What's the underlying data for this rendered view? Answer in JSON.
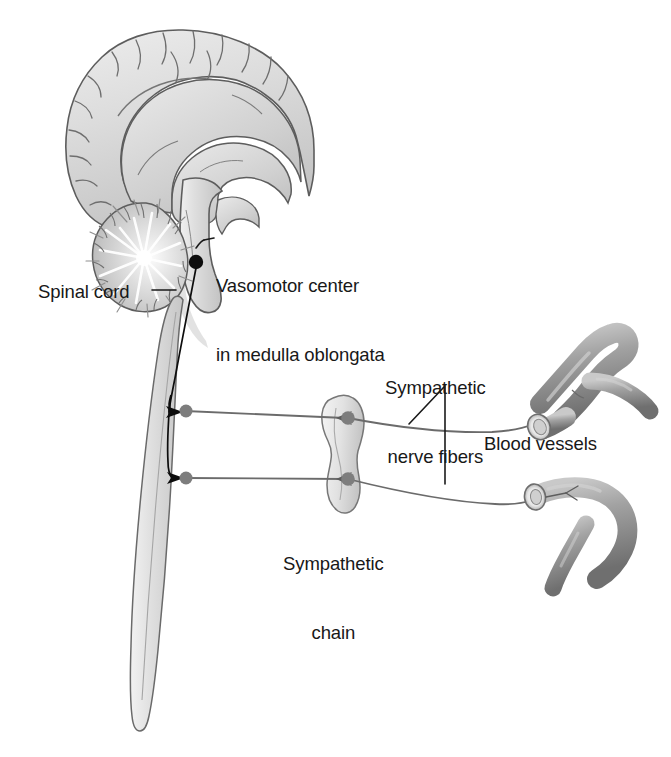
{
  "figure": {
    "background_color": "#ffffff",
    "width": 671,
    "height": 757
  },
  "palette": {
    "tissue_fill_light": "#e3e3e3",
    "tissue_fill_mid": "#d2d2d2",
    "tissue_fill_dark": "#b4b4b4",
    "outline": "#5d5d5d",
    "outline_dark": "#3c3c3c",
    "nerve_line": "#6b6b6b",
    "nerve_node": "#7d7d7d",
    "pathway_line": "#0d0d0d",
    "vessel_fill": "#9a9a9a",
    "vessel_shadow": "#6e6e6e",
    "vessel_lumen": "#efefef",
    "label_text": "#181818",
    "leader_line": "#1a1a1a"
  },
  "labels": {
    "vasomotor": {
      "line1": "Vasomotor center",
      "line2": "in medulla oblongata",
      "text": "Vasomotor center\nin medulla oblongata"
    },
    "spinal_cord": {
      "text": "Spinal cord"
    },
    "sympathetic_nerve_fibers": {
      "line1": "Sympathetic",
      "line2": "nerve fibers",
      "text": "Sympathetic\nnerve fibers"
    },
    "blood_vessels": {
      "text": "Blood vessels"
    },
    "sympathetic_chain": {
      "line1": "Sympathetic",
      "line2": "chain",
      "text": "Sympathetic\nchain"
    }
  },
  "structures": [
    {
      "id": "cerebrum",
      "name": "Cerebrum (midsagittal section)"
    },
    {
      "id": "corpus-callosum",
      "name": "Corpus callosum"
    },
    {
      "id": "thalamus",
      "name": "Thalamus / diencephalon"
    },
    {
      "id": "cerebellum",
      "name": "Cerebellum with arbor vitae"
    },
    {
      "id": "brainstem",
      "name": "Brainstem / pons"
    },
    {
      "id": "medulla-oblongata",
      "name": "Medulla oblongata"
    },
    {
      "id": "spinal-cord",
      "name": "Spinal cord"
    },
    {
      "id": "vasomotor-center",
      "name": "Vasomotor center marker"
    },
    {
      "id": "sympathetic-chain-ganglion",
      "name": "Sympathetic chain ganglion"
    },
    {
      "id": "blood-vessel-upper",
      "name": "Upper branching blood vessel"
    },
    {
      "id": "blood-vessel-lower",
      "name": "Lower branching blood vessel"
    }
  ],
  "pathway": {
    "description": "Descending pathway from vasomotor center through spinal cord to preganglionic exit points",
    "exit_points": 2
  },
  "nerve_fibers": [
    {
      "id": "fiber-upper",
      "from": "spinal-cord",
      "via": "sympathetic-chain-ganglion",
      "to": "blood-vessel-upper"
    },
    {
      "id": "fiber-lower",
      "from": "spinal-cord",
      "via": "sympathetic-chain-ganglion",
      "to": "blood-vessel-lower"
    }
  ]
}
